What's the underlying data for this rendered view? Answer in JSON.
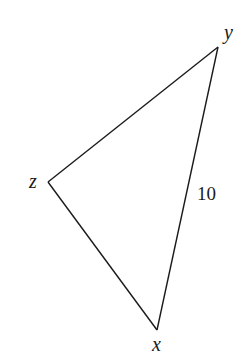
{
  "diagram": {
    "type": "triangle",
    "vertices": {
      "x": {
        "label": "x",
        "px": 157,
        "py": 330
      },
      "y": {
        "label": "y",
        "px": 218,
        "py": 47
      },
      "z": {
        "label": "z",
        "px": 48,
        "py": 182
      }
    },
    "sides": [
      {
        "from": "x",
        "to": "y",
        "label": "10"
      },
      {
        "from": "y",
        "to": "z",
        "label": ""
      },
      {
        "from": "z",
        "to": "x",
        "label": ""
      }
    ],
    "labels": {
      "vertex_x": "x",
      "vertex_y": "y",
      "vertex_z": "z",
      "side_xy": "10"
    },
    "colors": {
      "stroke": "#1a1a1a",
      "background": "#ffffff"
    }
  }
}
